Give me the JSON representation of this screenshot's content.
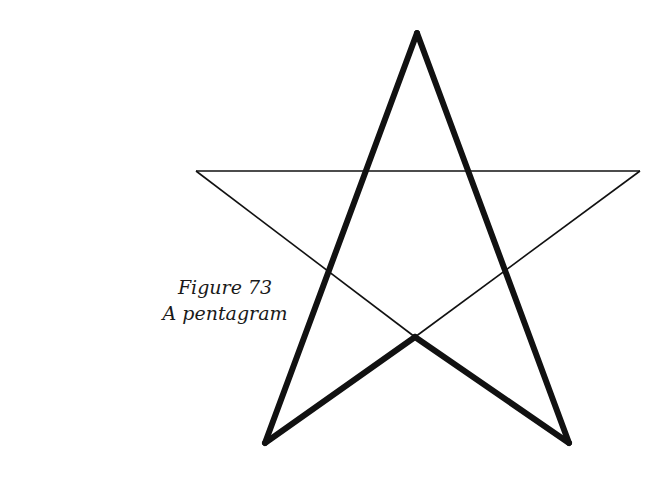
{
  "figure": {
    "number_label": "Figure 73",
    "title": "A pentagram",
    "colors": {
      "stroke": "#111111",
      "background": "#ffffff"
    },
    "points": {
      "top": [
        417,
        33
      ],
      "left_tip": [
        196,
        171
      ],
      "right_tip": [
        640,
        171
      ],
      "inner_bottom": [
        415,
        337
      ],
      "bottom_left": [
        265,
        443
      ],
      "bottom_right": [
        569,
        443
      ]
    },
    "thick_lines": [
      [
        "top",
        "bottom_left"
      ],
      [
        "top",
        "bottom_right"
      ],
      [
        "bottom_left",
        "inner_bottom"
      ],
      [
        "inner_bottom",
        "bottom_right"
      ]
    ],
    "thin_lines": [
      [
        "left_tip",
        "right_tip"
      ],
      [
        "left_tip",
        "inner_bottom"
      ],
      [
        "inner_bottom",
        "right_tip"
      ]
    ]
  }
}
